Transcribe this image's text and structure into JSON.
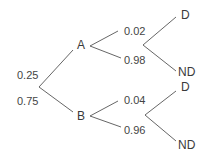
{
  "diagram": {
    "type": "probability-tree",
    "colors": {
      "line": "#555555",
      "text": "#444444",
      "background": "#ffffff"
    },
    "root_branches": [
      {
        "node": "A",
        "probability": "0.25"
      },
      {
        "node": "B",
        "probability": "0.75"
      }
    ],
    "A": {
      "label": "A",
      "branches": [
        {
          "outcome": "D",
          "probability": "0.02"
        },
        {
          "outcome": "ND",
          "probability": "0.98"
        }
      ]
    },
    "B": {
      "label": "B",
      "branches": [
        {
          "outcome": "D",
          "probability": "0.04"
        },
        {
          "outcome": "ND",
          "probability": "0.96"
        }
      ]
    }
  }
}
